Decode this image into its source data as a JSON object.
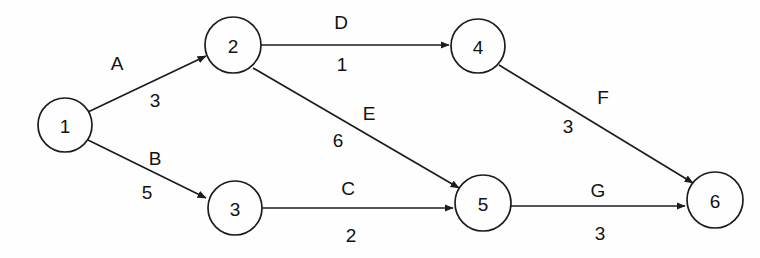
{
  "diagram": {
    "type": "directed-weighted-graph",
    "background_color": "#fefefe",
    "stroke_color": "#1c1c1c",
    "text_color": "#121212",
    "nodes": [
      {
        "id": "1",
        "label": "1",
        "cx": 65,
        "cy": 125,
        "r": 27
      },
      {
        "id": "2",
        "label": "2",
        "cx": 233,
        "cy": 45,
        "r": 28
      },
      {
        "id": "3",
        "label": "3",
        "cx": 235,
        "cy": 208,
        "r": 27
      },
      {
        "id": "4",
        "label": "4",
        "cx": 478,
        "cy": 46,
        "r": 27
      },
      {
        "id": "5",
        "label": "5",
        "cx": 483,
        "cy": 203,
        "r": 28
      },
      {
        "id": "6",
        "label": "6",
        "cx": 715,
        "cy": 200,
        "r": 28
      }
    ],
    "edges": [
      {
        "id": "A",
        "name": "A",
        "weight": "3",
        "from": "1",
        "to": "2",
        "x1": 88,
        "y1": 112,
        "x2": 206,
        "y2": 56,
        "name_x": 117,
        "name_y": 63,
        "weight_x": 155,
        "weight_y": 100
      },
      {
        "id": "B",
        "name": "B",
        "weight": "5",
        "from": "1",
        "to": "3",
        "x1": 88,
        "y1": 140,
        "x2": 206,
        "y2": 198,
        "name_x": 155,
        "name_y": 158,
        "weight_x": 147,
        "weight_y": 192
      },
      {
        "id": "D",
        "name": "D",
        "weight": "1",
        "from": "2",
        "to": "4",
        "x1": 261,
        "y1": 45,
        "x2": 449,
        "y2": 45,
        "name_x": 341,
        "name_y": 22,
        "weight_x": 342,
        "weight_y": 64
      },
      {
        "id": "E",
        "name": "E",
        "weight": "6",
        "from": "2",
        "to": "5",
        "x1": 253,
        "y1": 68,
        "x2": 459,
        "y2": 188,
        "name_x": 369,
        "name_y": 113,
        "weight_x": 338,
        "weight_y": 140
      },
      {
        "id": "C",
        "name": "C",
        "weight": "2",
        "from": "3",
        "to": "5",
        "x1": 262,
        "y1": 208,
        "x2": 453,
        "y2": 208,
        "name_x": 348,
        "name_y": 188,
        "weight_x": 351,
        "weight_y": 235
      },
      {
        "id": "F",
        "name": "F",
        "weight": "3",
        "from": "4",
        "to": "6",
        "x1": 499,
        "y1": 65,
        "x2": 693,
        "y2": 183,
        "name_x": 603,
        "name_y": 97,
        "weight_x": 568,
        "weight_y": 126
      },
      {
        "id": "G",
        "name": "G",
        "weight": "3",
        "from": "5",
        "to": "6",
        "x1": 511,
        "y1": 206,
        "x2": 685,
        "y2": 206,
        "name_x": 598,
        "name_y": 190,
        "weight_x": 600,
        "weight_y": 233
      }
    ]
  }
}
